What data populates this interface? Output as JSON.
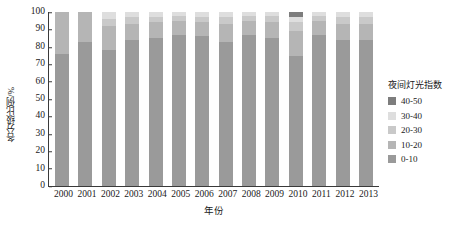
{
  "chart_data": {
    "type": "bar",
    "stacked": true,
    "stack_mode": "percent",
    "title": "",
    "xlabel": "年份",
    "ylabel": "各分级比例/%",
    "ylim": [
      0,
      100
    ],
    "yticks": [
      0,
      10,
      20,
      30,
      40,
      50,
      60,
      70,
      80,
      90,
      100
    ],
    "ytick_labels": [
      "0",
      "10",
      "20",
      "30",
      "40",
      "50",
      "60",
      "70",
      "80",
      "90",
      "100"
    ],
    "grid": false,
    "legend_position": "right",
    "legend_title": "夜间灯光指数",
    "categories": [
      "2000",
      "2001",
      "2002",
      "2003",
      "2004",
      "2005",
      "2006",
      "2007",
      "2008",
      "2009",
      "2010",
      "2011",
      "2012",
      "2013"
    ],
    "series": [
      {
        "name": "0-10",
        "color": "#9a9a9a",
        "values": [
          76,
          83,
          78,
          84,
          85,
          87,
          86,
          83,
          87,
          85,
          75,
          87,
          84,
          84
        ]
      },
      {
        "name": "10-20",
        "color": "#b5b5b5",
        "values": [
          24,
          17,
          14,
          9,
          9,
          8,
          8,
          10,
          8,
          9,
          14,
          8,
          9,
          9
        ]
      },
      {
        "name": "20-30",
        "color": "#c9c9c9",
        "values": [
          0,
          0,
          4,
          4,
          3,
          3,
          3,
          4,
          3,
          4,
          5,
          3,
          4,
          4
        ]
      },
      {
        "name": "30-40",
        "color": "#dedede",
        "values": [
          0,
          0,
          4,
          3,
          3,
          2,
          3,
          3,
          2,
          2,
          3,
          2,
          3,
          3
        ]
      },
      {
        "name": "40-50",
        "color": "#7d7d7d",
        "values": [
          0,
          0,
          0,
          0,
          0,
          0,
          0,
          0,
          0,
          0,
          3,
          0,
          0,
          0
        ]
      }
    ],
    "legend_entries": [
      {
        "label": "40-50",
        "color": "#7d7d7d"
      },
      {
        "label": "30-40",
        "color": "#dedede"
      },
      {
        "label": "20-30",
        "color": "#c9c9c9"
      },
      {
        "label": "10-20",
        "color": "#b5b5b5"
      },
      {
        "label": "0-10",
        "color": "#9a9a9a"
      }
    ],
    "axis_color": "#3a3a3a"
  }
}
